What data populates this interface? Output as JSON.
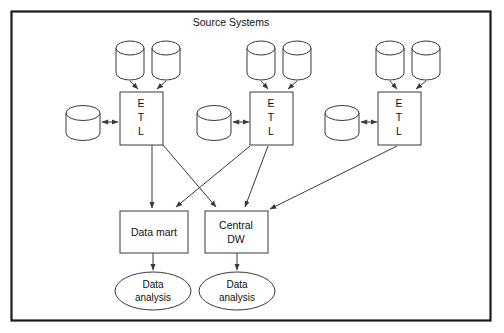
{
  "diagram": {
    "title": "Source Systems",
    "type": "data-warehouse-architecture",
    "colors": {
      "frame_stroke": "#1c1c1c",
      "shape_stroke": "#3a3a3a",
      "shape_fill": "#ffffff",
      "text": "#111111",
      "background": "#ffffff"
    },
    "etl_groups": [
      {
        "id": "etl-left",
        "process_label": "ETL",
        "process_letters": [
          "E",
          "T",
          "L"
        ],
        "source_databases_top": 2,
        "source_databases_side": 1
      },
      {
        "id": "etl-middle",
        "process_label": "ETL",
        "process_letters": [
          "E",
          "T",
          "L"
        ],
        "source_databases_top": 2,
        "source_databases_side": 1
      },
      {
        "id": "etl-right",
        "process_label": "ETL",
        "process_letters": [
          "E",
          "T",
          "L"
        ],
        "source_databases_top": 2,
        "source_databases_side": 1
      }
    ],
    "targets": [
      {
        "id": "data-mart",
        "label": "Data mart",
        "lines": [
          "Data mart"
        ]
      },
      {
        "id": "central-dw",
        "label": "Central DW",
        "lines": [
          "Central",
          "DW"
        ]
      }
    ],
    "outputs": [
      {
        "id": "data-analysis-left",
        "label": "Data analysis",
        "lines": [
          "Data",
          "analysis"
        ]
      },
      {
        "id": "data-analysis-right",
        "label": "Data analysis",
        "lines": [
          "Data",
          "analysis"
        ]
      }
    ],
    "flows": [
      {
        "from": "etl-left",
        "to": "data-mart"
      },
      {
        "from": "etl-left",
        "to": "central-dw"
      },
      {
        "from": "etl-middle",
        "to": "data-mart"
      },
      {
        "from": "etl-middle",
        "to": "central-dw"
      },
      {
        "from": "etl-right",
        "to": "central-dw"
      },
      {
        "from": "data-mart",
        "to": "data-analysis-left"
      },
      {
        "from": "central-dw",
        "to": "data-analysis-right"
      }
    ]
  }
}
